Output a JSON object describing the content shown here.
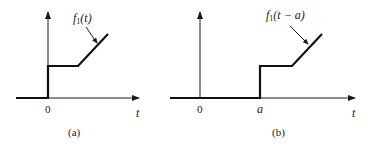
{
  "panels": [
    {
      "id": "a",
      "caption": "(a)",
      "function_label": {
        "name": "f",
        "subscript": "1",
        "arg": "(t)"
      },
      "x_axis_label": "t",
      "origin_label": "0",
      "step_label": null,
      "description": "Step at t=0 to constant level, then linearly increasing ramp"
    },
    {
      "id": "b",
      "caption": "(b)",
      "function_label": {
        "name": "f",
        "subscript": "1",
        "arg": "(t − a)"
      },
      "x_axis_label": "t",
      "origin_label": "0",
      "step_label": "a",
      "description": "Same function shifted right by a: step at t=a, constant, then ramp"
    }
  ],
  "colors": {
    "ink": "#1a1a1a",
    "background": "#ffffff"
  }
}
